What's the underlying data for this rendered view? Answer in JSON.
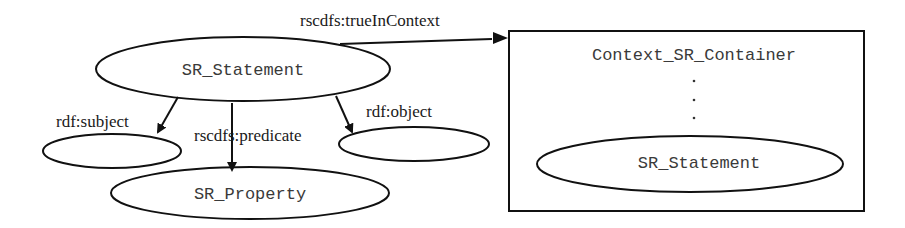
{
  "diagram": {
    "nodes": {
      "sr_statement": "SR_Statement",
      "subject_node": "",
      "object_node": "",
      "sr_property": "SR_Property",
      "container": "Context_SR_Container",
      "container_dots": [
        "·",
        "·",
        "·"
      ],
      "inner_statement": "SR_Statement"
    },
    "edges": {
      "true_in_context": "rscdfs:trueInContext",
      "subject": "rdf:subject",
      "predicate": "rscdfs:predicate",
      "object": "rdf:object"
    },
    "colors": {
      "stroke": "#111111",
      "label_text": "#1a1a1a",
      "node_text": "#3a3a3a",
      "background": "#ffffff"
    }
  }
}
